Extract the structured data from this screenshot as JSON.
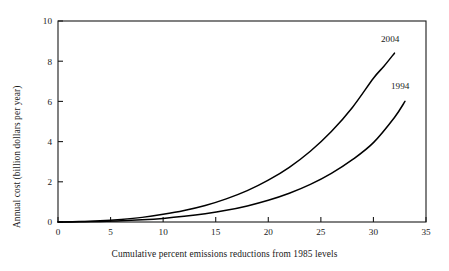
{
  "chart_data": {
    "type": "line",
    "title": "",
    "xlabel": "Cumulative percent emissions reductions from 1985 levels",
    "ylabel": "Annual cost (billion dollars per year)",
    "xlim": [
      0,
      35
    ],
    "ylim": [
      0,
      10
    ],
    "xticks": [
      0,
      5,
      10,
      15,
      20,
      25,
      30,
      35
    ],
    "yticks": [
      0,
      2,
      4,
      6,
      8,
      10
    ],
    "xtick_labels": [
      "0",
      "5",
      "10",
      "15",
      "20",
      "25",
      "30",
      "35"
    ],
    "ytick_labels": [
      "0",
      "2",
      "4",
      "6",
      "8",
      "10"
    ],
    "grid": false,
    "legend": "inline-curve-labels",
    "series": [
      {
        "name": "2004",
        "label": "2004",
        "color": "#000000",
        "x": [
          0,
          2,
          4,
          6,
          8,
          10,
          12,
          14,
          16,
          18,
          20,
          22,
          24,
          26,
          28,
          30,
          31,
          32
        ],
        "values": [
          0.0,
          0.02,
          0.06,
          0.13,
          0.23,
          0.38,
          0.57,
          0.82,
          1.15,
          1.56,
          2.08,
          2.72,
          3.52,
          4.5,
          5.7,
          7.15,
          7.75,
          8.4
        ]
      },
      {
        "name": "1994",
        "label": "1994",
        "color": "#000000",
        "x": [
          0,
          2,
          4,
          6,
          8,
          10,
          12,
          14,
          16,
          18,
          20,
          22,
          24,
          26,
          28,
          30,
          32,
          33
        ],
        "values": [
          0.0,
          0.01,
          0.03,
          0.06,
          0.11,
          0.18,
          0.28,
          0.41,
          0.58,
          0.8,
          1.08,
          1.43,
          1.87,
          2.42,
          3.1,
          3.95,
          5.2,
          6.0
        ]
      }
    ]
  },
  "axes": {
    "frame_color": "#1a1a1a"
  }
}
